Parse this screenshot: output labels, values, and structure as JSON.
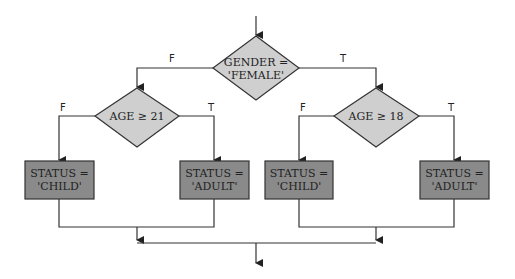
{
  "diagram": {
    "type": "flowchart",
    "decision_root": {
      "line1": "GENDER =",
      "line2": "'FEMALE'"
    },
    "decision_left": {
      "text": "AGE ≥ 21"
    },
    "decision_right": {
      "text": "AGE ≥ 18"
    },
    "branch_labels": {
      "root_false": "F",
      "root_true": "T",
      "left_false": "F",
      "left_true": "T",
      "right_false": "F",
      "right_true": "T"
    },
    "boxes": [
      {
        "line1": "STATUS =",
        "line2": "'CHILD'"
      },
      {
        "line1": "STATUS =",
        "line2": "'ADULT'"
      },
      {
        "line1": "STATUS =",
        "line2": "'CHILD'"
      },
      {
        "line1": "STATUS =",
        "line2": "'ADULT'"
      }
    ],
    "colors": {
      "diamond_fill": "#cfcfcf",
      "box_fill": "#8a8a8a",
      "stroke": "#333333"
    }
  }
}
